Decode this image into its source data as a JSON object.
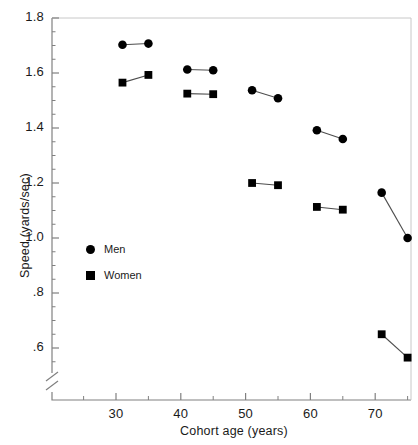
{
  "chart_data": {
    "type": "line",
    "title": "",
    "xlabel": "Cohort age (years)",
    "ylabel": "Speed (yards/sec)",
    "xlim": [
      23,
      78
    ],
    "ylim": [
      0.52,
      1.8
    ],
    "grid": false,
    "axis_break": true,
    "legend_position": "inside-left",
    "x_ticks_major": [
      30,
      40,
      50,
      60,
      70
    ],
    "x_ticks_major_labels": [
      "30",
      "40",
      "50",
      "60",
      "70"
    ],
    "x_ticks_minor": [
      25,
      35,
      45,
      55,
      65,
      75
    ],
    "y_ticks_major": [
      0.6,
      0.8,
      1.0,
      1.2,
      1.4,
      1.6,
      1.8
    ],
    "y_ticks_major_labels": [
      ".6",
      ".8",
      "1.0",
      "1.2",
      "1.4",
      "1.6",
      "1.8"
    ],
    "series": [
      {
        "name": "Men",
        "marker": "circle",
        "segments": [
          {
            "x": [
              31,
              35
            ],
            "y": [
              1.703,
              1.707
            ]
          },
          {
            "x": [
              41,
              45
            ],
            "y": [
              1.613,
              1.61
            ]
          },
          {
            "x": [
              51,
              55
            ],
            "y": [
              1.537,
              1.508
            ]
          },
          {
            "x": [
              61,
              65
            ],
            "y": [
              1.392,
              1.36
            ]
          },
          {
            "x": [
              71,
              75
            ],
            "y": [
              1.165,
              1.0
            ]
          }
        ]
      },
      {
        "name": "Women",
        "marker": "square",
        "segments": [
          {
            "x": [
              31,
              35
            ],
            "y": [
              1.565,
              1.593
            ]
          },
          {
            "x": [
              41,
              45
            ],
            "y": [
              1.525,
              1.523
            ]
          },
          {
            "x": [
              51,
              55
            ],
            "y": [
              1.2,
              1.192
            ]
          },
          {
            "x": [
              61,
              65
            ],
            "y": [
              1.113,
              1.103
            ]
          },
          {
            "x": [
              71,
              75
            ],
            "y": [
              0.65,
              0.565
            ]
          }
        ]
      }
    ],
    "legend": [
      {
        "label": "Men",
        "marker": "circle"
      },
      {
        "label": "Women",
        "marker": "square"
      }
    ],
    "colors": {
      "marker": "#000000",
      "line": "#4d4d4d",
      "axis": "#808080",
      "text": "#1a1a1a"
    }
  }
}
